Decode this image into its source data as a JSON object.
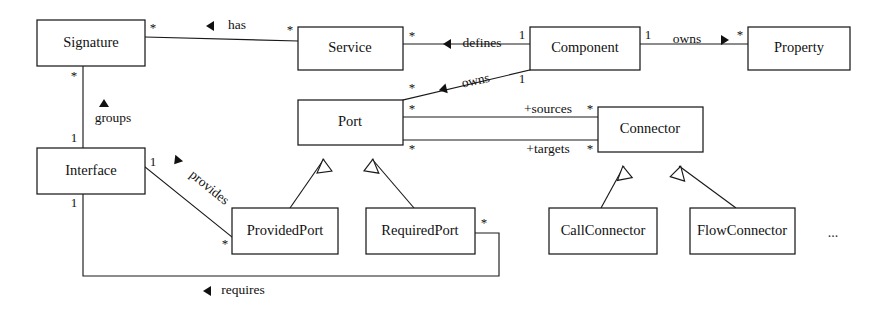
{
  "diagram": {
    "type": "uml-class-diagram",
    "canvas": {
      "width": 884,
      "height": 313
    },
    "colors": {
      "background": "#ffffff",
      "stroke": "#1a1a1a",
      "text": "#111111",
      "box_fill": "#ffffff"
    },
    "classes": [
      {
        "id": "signature",
        "label": "Signature",
        "x": 37,
        "y": 20,
        "w": 108,
        "h": 46
      },
      {
        "id": "service",
        "label": "Service",
        "x": 298,
        "y": 27,
        "w": 105,
        "h": 43
      },
      {
        "id": "component",
        "label": "Component",
        "x": 530,
        "y": 27,
        "w": 110,
        "h": 43
      },
      {
        "id": "property",
        "label": "Property",
        "x": 748,
        "y": 27,
        "w": 102,
        "h": 43
      },
      {
        "id": "port",
        "label": "Port",
        "x": 298,
        "y": 100,
        "w": 105,
        "h": 45
      },
      {
        "id": "connector",
        "label": "Connector",
        "x": 598,
        "y": 107,
        "w": 105,
        "h": 45
      },
      {
        "id": "interface",
        "label": "Interface",
        "x": 37,
        "y": 148,
        "w": 108,
        "h": 46
      },
      {
        "id": "providedport",
        "label": "ProvidedPort",
        "x": 232,
        "y": 208,
        "w": 106,
        "h": 46
      },
      {
        "id": "requiredport",
        "label": "RequiredPort",
        "x": 366,
        "y": 208,
        "w": 109,
        "h": 46
      },
      {
        "id": "callconnector",
        "label": "CallConnector",
        "x": 549,
        "y": 208,
        "w": 108,
        "h": 46
      },
      {
        "id": "flowconnector",
        "label": "FlowConnector",
        "x": 690,
        "y": 208,
        "w": 105,
        "h": 46
      }
    ],
    "associations": [
      {
        "id": "has",
        "label": "has",
        "from": "signature",
        "to": "service",
        "from_mult": "*",
        "to_mult": "*",
        "direction": "left"
      },
      {
        "id": "defines",
        "label": "defines",
        "from": "service",
        "to": "component",
        "from_mult": "*",
        "to_mult": "1",
        "direction": "left"
      },
      {
        "id": "owns-property",
        "label": "owns",
        "from": "component",
        "to": "property",
        "from_mult": "1",
        "to_mult": "*",
        "direction": "right"
      },
      {
        "id": "owns-port",
        "label": "owns",
        "from": "component",
        "to": "port",
        "from_mult": "1",
        "to_mult": "*",
        "direction": "left"
      },
      {
        "id": "groups",
        "label": "groups",
        "from": "interface",
        "to": "signature",
        "from_mult": "1",
        "to_mult": "*",
        "direction": "up"
      },
      {
        "id": "sources",
        "label": "+sources",
        "from": "port",
        "to": "connector",
        "from_mult": "*",
        "to_mult": "*",
        "direction": "none"
      },
      {
        "id": "targets",
        "label": "+targets",
        "from": "port",
        "to": "connector",
        "from_mult": "*",
        "to_mult": "*",
        "direction": "none"
      },
      {
        "id": "provides",
        "label": "provides",
        "from": "interface",
        "to": "providedport",
        "from_mult": "1",
        "to_mult": "*",
        "direction": "down"
      },
      {
        "id": "requires",
        "label": "requires",
        "from": "interface",
        "to": "requiredport",
        "from_mult": "1",
        "to_mult": "*",
        "direction": "left"
      }
    ],
    "generalizations": [
      {
        "id": "providedport-port",
        "sub": "providedport",
        "super": "port"
      },
      {
        "id": "requiredport-port",
        "sub": "requiredport",
        "super": "port"
      },
      {
        "id": "callconnector-connector",
        "sub": "callconnector",
        "super": "connector"
      },
      {
        "id": "flowconnector-connector",
        "sub": "flowconnector",
        "super": "connector"
      }
    ],
    "ellipsis": "..."
  }
}
